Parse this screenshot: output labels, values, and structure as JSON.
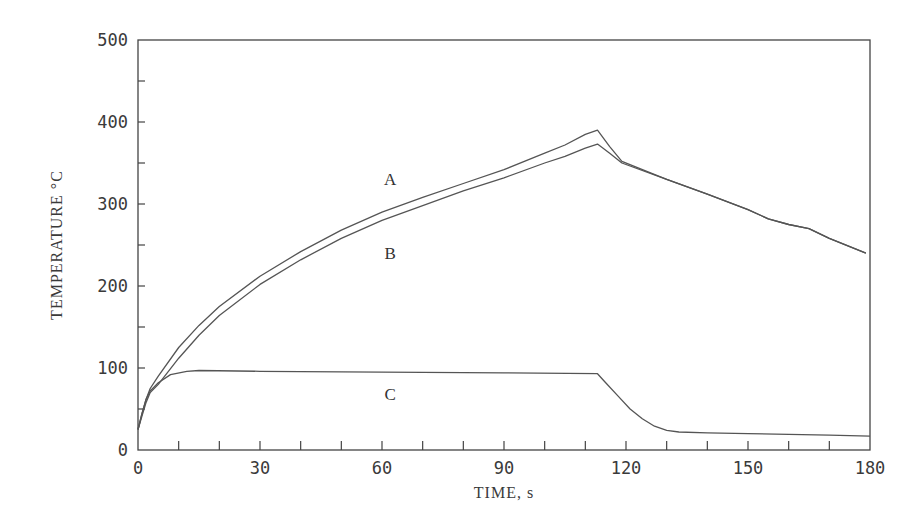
{
  "chart_data": {
    "type": "line",
    "title": "",
    "xlabel": "TIME, s",
    "ylabel": "TEMPERATURE °C",
    "xlim": [
      0,
      180
    ],
    "ylim": [
      0,
      500
    ],
    "x_ticks": [
      0,
      30,
      60,
      90,
      120,
      150,
      180
    ],
    "x_minor_step": 10,
    "y_ticks": [
      0,
      100,
      200,
      300,
      400,
      500
    ],
    "y_minor_step": 50,
    "grid": false,
    "legend": "none (inline curve labels A, B, C)",
    "series": [
      {
        "name": "A",
        "points": [
          [
            0,
            25
          ],
          [
            1,
            45
          ],
          [
            2,
            62
          ],
          [
            3,
            75
          ],
          [
            5,
            90
          ],
          [
            10,
            125
          ],
          [
            15,
            152
          ],
          [
            20,
            175
          ],
          [
            30,
            212
          ],
          [
            40,
            242
          ],
          [
            50,
            268
          ],
          [
            60,
            290
          ],
          [
            70,
            308
          ],
          [
            80,
            325
          ],
          [
            90,
            342
          ],
          [
            100,
            362
          ],
          [
            105,
            372
          ],
          [
            110,
            385
          ],
          [
            113,
            390
          ],
          [
            116,
            370
          ],
          [
            119,
            352
          ],
          [
            130,
            330
          ],
          [
            140,
            312
          ],
          [
            150,
            293
          ],
          [
            155,
            282
          ],
          [
            160,
            275
          ],
          [
            165,
            270
          ],
          [
            170,
            258
          ],
          [
            179,
            240
          ]
        ]
      },
      {
        "name": "B",
        "points": [
          [
            0,
            25
          ],
          [
            1,
            42
          ],
          [
            2,
            58
          ],
          [
            3,
            70
          ],
          [
            5,
            80
          ],
          [
            10,
            112
          ],
          [
            15,
            140
          ],
          [
            20,
            164
          ],
          [
            30,
            202
          ],
          [
            40,
            232
          ],
          [
            50,
            258
          ],
          [
            60,
            280
          ],
          [
            70,
            298
          ],
          [
            80,
            316
          ],
          [
            90,
            332
          ],
          [
            100,
            350
          ],
          [
            105,
            358
          ],
          [
            110,
            368
          ],
          [
            113,
            373
          ],
          [
            116,
            362
          ],
          [
            119,
            350
          ],
          [
            130,
            330
          ],
          [
            140,
            312
          ],
          [
            150,
            293
          ],
          [
            155,
            282
          ],
          [
            160,
            275
          ],
          [
            165,
            270
          ],
          [
            170,
            258
          ],
          [
            179,
            240
          ]
        ]
      },
      {
        "name": "C",
        "points": [
          [
            0,
            25
          ],
          [
            1,
            45
          ],
          [
            2,
            62
          ],
          [
            3,
            72
          ],
          [
            5,
            82
          ],
          [
            8,
            92
          ],
          [
            12,
            96
          ],
          [
            15,
            97
          ],
          [
            30,
            96
          ],
          [
            60,
            95
          ],
          [
            90,
            94
          ],
          [
            113,
            93
          ],
          [
            115,
            82
          ],
          [
            118,
            66
          ],
          [
            121,
            50
          ],
          [
            124,
            38
          ],
          [
            127,
            29
          ],
          [
            130,
            24
          ],
          [
            133,
            22
          ],
          [
            140,
            21
          ],
          [
            150,
            20
          ],
          [
            160,
            19
          ],
          [
            170,
            18
          ],
          [
            180,
            17
          ]
        ]
      }
    ],
    "annotations": [
      {
        "text": "A",
        "x": 62,
        "y": 330
      },
      {
        "text": "B",
        "x": 62,
        "y": 240
      },
      {
        "text": "C",
        "x": 62,
        "y": 68
      }
    ]
  },
  "labels": {
    "xlabel": "TIME, s",
    "ylabel": "TEMPERATURE °C",
    "curve_a": "A",
    "curve_b": "B",
    "curve_c": "C"
  },
  "style": {
    "line_color": "#555555",
    "axis_color": "#444444",
    "background": "#ffffff"
  }
}
